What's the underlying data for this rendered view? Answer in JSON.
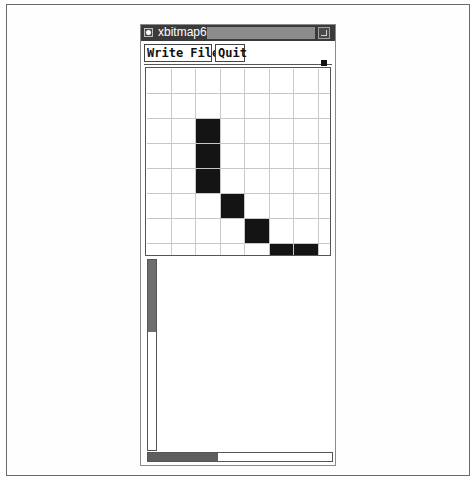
{
  "window": {
    "title": "xbitmap6",
    "icons": {
      "close": "window-menu-icon",
      "resize": "maximize-icon"
    }
  },
  "toolbar": {
    "write_file_label": "Write File",
    "quit_label": "Quit"
  },
  "bitmap": {
    "visible_columns": 8,
    "visible_rows": 8,
    "filled_cells": [
      {
        "row": 2,
        "col": 2
      },
      {
        "row": 3,
        "col": 2
      },
      {
        "row": 4,
        "col": 2
      },
      {
        "row": 5,
        "col": 3
      },
      {
        "row": 6,
        "col": 4
      },
      {
        "row": 7,
        "col": 5
      },
      {
        "row": 7,
        "col": 6
      }
    ],
    "colors": {
      "on": "#141414",
      "off": "#ffffff",
      "grid_line": "#c8c8c8"
    }
  },
  "scrollbars": {
    "vertical": {
      "thumb_start_pct": 0,
      "thumb_size_pct": 37
    },
    "horizontal": {
      "thumb_start_pct": 0,
      "thumb_size_pct": 38
    }
  }
}
